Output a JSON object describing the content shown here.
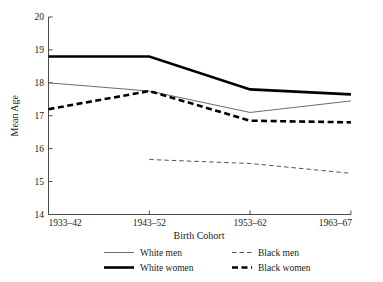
{
  "chart_data": {
    "type": "line",
    "title": "",
    "xlabel": "Birth Cohort",
    "ylabel": "Mean Age",
    "categories": [
      "1933–42",
      "1943–52",
      "1953–62",
      "1963–67"
    ],
    "ylim": [
      14,
      20
    ],
    "yticks": [
      14,
      15,
      16,
      17,
      18,
      19,
      20
    ],
    "ytick_labels": [
      "14",
      "15",
      "16",
      "17",
      "18",
      "19",
      "20"
    ],
    "grid": false,
    "legend_position": "bottom",
    "series": [
      {
        "name": "White men",
        "style": "thin-solid",
        "values": [
          18.0,
          17.75,
          17.1,
          17.45
        ]
      },
      {
        "name": "White women",
        "style": "thick-solid",
        "values": [
          18.8,
          18.8,
          17.8,
          17.65
        ]
      },
      {
        "name": "Black men",
        "style": "thin-dashed",
        "values": [
          null,
          15.67,
          15.55,
          15.25
        ]
      },
      {
        "name": "Black women",
        "style": "thick-dashed",
        "values": [
          17.2,
          17.75,
          16.85,
          16.8
        ]
      }
    ]
  },
  "axis": {
    "y_title": "Mean Age",
    "x_title": "Birth Cohort",
    "y_tick_20": "20",
    "y_tick_19": "19",
    "y_tick_18": "18",
    "y_tick_17": "17",
    "y_tick_16": "16",
    "y_tick_15": "15",
    "y_tick_14": "14",
    "x_tick_1": "1933–42",
    "x_tick_2": "1943–52",
    "x_tick_3": "1953–62",
    "x_tick_4": "1963–67"
  },
  "legend": {
    "entry_1": "White men",
    "entry_2": "White women",
    "entry_3": "Black men",
    "entry_4": "Black women"
  },
  "colors": {
    "axis": "#4a4a4a",
    "thin_line": "#6b6b6b",
    "thick_line": "#000000",
    "text": "#1a1a1a",
    "background": "#ffffff"
  }
}
